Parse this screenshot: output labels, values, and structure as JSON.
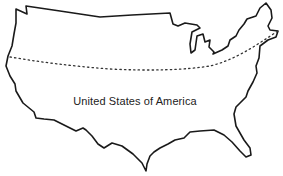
{
  "map": {
    "title": "United States of America",
    "region": "contiguous-united-states",
    "style": "hand-drawn outline",
    "features": [
      {
        "type": "country-outline",
        "name": "United States of America"
      },
      {
        "type": "dotted-latitude-line"
      }
    ],
    "label": {
      "text": "United States of America"
    },
    "colors": {
      "outline": "#1a1a1a",
      "fill": "#ffffff",
      "latitude_line": "#333333",
      "label": "#222222",
      "background": "#ffffff"
    }
  }
}
